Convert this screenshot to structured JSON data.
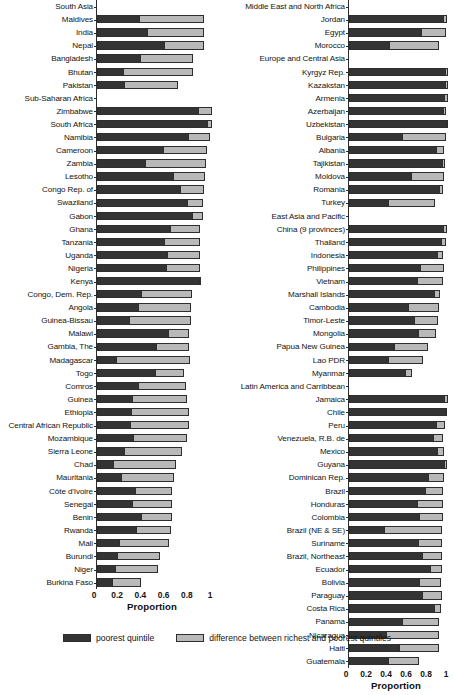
{
  "chart_data": {
    "type": "bar",
    "orientation": "horizontal",
    "stacked": true,
    "title": "",
    "xlabel": "Proportion",
    "ylabel": "",
    "xlim": [
      0,
      1
    ],
    "xticks": [
      "0",
      "0.2",
      "0.4",
      "0.6",
      "0.8",
      "1"
    ],
    "xtick_values": [
      0,
      0.2,
      0.4,
      0.6,
      0.8,
      1
    ],
    "grid": false,
    "legend_position": "bottom",
    "series": [
      {
        "name": "poorest quintile",
        "color": "#343434"
      },
      {
        "name": "difference between richest and poorest quintiles",
        "color": "#b9b9b9"
      }
    ],
    "panels": [
      {
        "panel_id": "left",
        "rows": [
          {
            "label": "South Asia",
            "group": true,
            "poorest": null,
            "difference": null
          },
          {
            "label": "Maldives",
            "group": false,
            "poorest": 0.36,
            "difference": 0.56
          },
          {
            "label": "India",
            "group": false,
            "poorest": 0.43,
            "difference": 0.49
          },
          {
            "label": "Nepal",
            "group": false,
            "poorest": 0.58,
            "difference": 0.34
          },
          {
            "label": "Bangladesh",
            "group": false,
            "poorest": 0.37,
            "difference": 0.46
          },
          {
            "label": "Bhutan",
            "group": false,
            "poorest": 0.22,
            "difference": 0.61
          },
          {
            "label": "Pakistan",
            "group": false,
            "poorest": 0.23,
            "difference": 0.47
          },
          {
            "label": "Sub-Saharan Africa",
            "group": true,
            "poorest": null,
            "difference": null
          },
          {
            "label": "Zimbabwe",
            "group": false,
            "poorest": 0.88,
            "difference": 0.11
          },
          {
            "label": "South Africa",
            "group": false,
            "poorest": 0.96,
            "difference": 0.03
          },
          {
            "label": "Namibia",
            "group": false,
            "poorest": 0.79,
            "difference": 0.18
          },
          {
            "label": "Cameroon",
            "group": false,
            "poorest": 0.57,
            "difference": 0.38
          },
          {
            "label": "Zambia",
            "group": false,
            "poorest": 0.41,
            "difference": 0.53
          },
          {
            "label": "Lesotho",
            "group": false,
            "poorest": 0.66,
            "difference": 0.27
          },
          {
            "label": "Congo Rep. of",
            "group": false,
            "poorest": 0.72,
            "difference": 0.2
          },
          {
            "label": "Swaziland",
            "group": false,
            "poorest": 0.78,
            "difference": 0.13
          },
          {
            "label": "Gabon",
            "group": false,
            "poorest": 0.83,
            "difference": 0.08
          },
          {
            "label": "Ghana",
            "group": false,
            "poorest": 0.63,
            "difference": 0.26
          },
          {
            "label": "Tanzania",
            "group": false,
            "poorest": 0.58,
            "difference": 0.31
          },
          {
            "label": "Uganda",
            "group": false,
            "poorest": 0.61,
            "difference": 0.28
          },
          {
            "label": "Nigeria",
            "group": false,
            "poorest": 0.6,
            "difference": 0.29
          },
          {
            "label": "Kenya",
            "group": false,
            "poorest": 0.9,
            "difference": 0.0
          },
          {
            "label": "Congo, Dem. Rep.",
            "group": false,
            "poorest": 0.38,
            "difference": 0.44
          },
          {
            "label": "Angola",
            "group": false,
            "poorest": 0.35,
            "difference": 0.46
          },
          {
            "label": "Guinea-Bissau",
            "group": false,
            "poorest": 0.27,
            "difference": 0.54
          },
          {
            "label": "Malawi",
            "group": false,
            "poorest": 0.62,
            "difference": 0.17
          },
          {
            "label": "Gambia, The",
            "group": false,
            "poorest": 0.51,
            "difference": 0.28
          },
          {
            "label": "Madagascar",
            "group": false,
            "poorest": 0.16,
            "difference": 0.64
          },
          {
            "label": "Togo",
            "group": false,
            "poorest": 0.5,
            "difference": 0.25
          },
          {
            "label": "Comros",
            "group": false,
            "poorest": 0.35,
            "difference": 0.42
          },
          {
            "label": "Guinea",
            "group": false,
            "poorest": 0.3,
            "difference": 0.48
          },
          {
            "label": "Ethiopia",
            "group": false,
            "poorest": 0.29,
            "difference": 0.5
          },
          {
            "label": "Central African Republic",
            "group": false,
            "poorest": 0.28,
            "difference": 0.51
          },
          {
            "label": "Mozambique",
            "group": false,
            "poorest": 0.31,
            "difference": 0.47
          },
          {
            "label": "Sierra Leone",
            "group": false,
            "poorest": 0.23,
            "difference": 0.5
          },
          {
            "label": "Chad",
            "group": false,
            "poorest": 0.13,
            "difference": 0.55
          },
          {
            "label": "Mauritania",
            "group": false,
            "poorest": 0.2,
            "difference": 0.46
          },
          {
            "label": "Côte d'Ivoire",
            "group": false,
            "poorest": 0.33,
            "difference": 0.32
          },
          {
            "label": "Senegal",
            "group": false,
            "poorest": 0.3,
            "difference": 0.35
          },
          {
            "label": "Benin",
            "group": false,
            "poorest": 0.38,
            "difference": 0.27
          },
          {
            "label": "Rwanda",
            "group": false,
            "poorest": 0.34,
            "difference": 0.3
          },
          {
            "label": "Mali",
            "group": false,
            "poorest": 0.19,
            "difference": 0.43
          },
          {
            "label": "Burundi",
            "group": false,
            "poorest": 0.17,
            "difference": 0.37
          },
          {
            "label": "Niger",
            "group": false,
            "poorest": 0.15,
            "difference": 0.38
          },
          {
            "label": "Burkina Faso",
            "group": false,
            "poorest": 0.13,
            "difference": 0.25
          }
        ]
      },
      {
        "panel_id": "right",
        "rows": [
          {
            "label": "Middle East and North Africa",
            "group": true,
            "poorest": null,
            "difference": null
          },
          {
            "label": "Jordan",
            "group": false,
            "poorest": 0.95,
            "difference": 0.03
          },
          {
            "label": "Egypt",
            "group": false,
            "poorest": 0.72,
            "difference": 0.25
          },
          {
            "label": "Morocco",
            "group": false,
            "poorest": 0.4,
            "difference": 0.5
          },
          {
            "label": "Europe and Central Asia",
            "group": true,
            "poorest": null,
            "difference": null
          },
          {
            "label": "Kyrgyz Rep.",
            "group": false,
            "poorest": 0.97,
            "difference": 0.02
          },
          {
            "label": "Kazakstan",
            "group": false,
            "poorest": 0.97,
            "difference": 0.02
          },
          {
            "label": "Armenia",
            "group": false,
            "poorest": 0.96,
            "difference": 0.03
          },
          {
            "label": "Azerbaijan",
            "group": false,
            "poorest": 0.95,
            "difference": 0.02
          },
          {
            "label": "Uzbekistan",
            "group": false,
            "poorest": 0.98,
            "difference": 0.01
          },
          {
            "label": "Bulgaria",
            "group": false,
            "poorest": 0.53,
            "difference": 0.44
          },
          {
            "label": "Albania",
            "group": false,
            "poorest": 0.88,
            "difference": 0.07
          },
          {
            "label": "Tajikistan",
            "group": false,
            "poorest": 0.94,
            "difference": 0.02
          },
          {
            "label": "Moldova",
            "group": false,
            "poorest": 0.62,
            "difference": 0.33
          },
          {
            "label": "Romania",
            "group": false,
            "poorest": 0.91,
            "difference": 0.03
          },
          {
            "label": "Turkey",
            "group": false,
            "poorest": 0.39,
            "difference": 0.47
          },
          {
            "label": "East Asia and Pacific",
            "group": true,
            "poorest": null,
            "difference": null
          },
          {
            "label": "China (9 provinces)",
            "group": false,
            "poorest": 0.95,
            "difference": 0.03
          },
          {
            "label": "Thailand",
            "group": false,
            "poorest": 0.93,
            "difference": 0.04
          },
          {
            "label": "Indonesia",
            "group": false,
            "poorest": 0.89,
            "difference": 0.05
          },
          {
            "label": "Philippines",
            "group": false,
            "poorest": 0.72,
            "difference": 0.23
          },
          {
            "label": "Vietnam",
            "group": false,
            "poorest": 0.68,
            "difference": 0.26
          },
          {
            "label": "Marshall Islands",
            "group": false,
            "poorest": 0.86,
            "difference": 0.05
          },
          {
            "label": "Cambodia",
            "group": false,
            "poorest": 0.59,
            "difference": 0.31
          },
          {
            "label": "Timor-Leste",
            "group": false,
            "poorest": 0.65,
            "difference": 0.24
          },
          {
            "label": "Mongolia",
            "group": false,
            "poorest": 0.7,
            "difference": 0.17
          },
          {
            "label": "Papua New Guinea",
            "group": false,
            "poorest": 0.45,
            "difference": 0.34
          },
          {
            "label": "Lao PDR",
            "group": false,
            "poorest": 0.39,
            "difference": 0.35
          },
          {
            "label": "Myanmar",
            "group": false,
            "poorest": 0.57,
            "difference": 0.06
          },
          {
            "label": "Latin America and Carribbean",
            "group": true,
            "poorest": null,
            "difference": null
          },
          {
            "label": "Jamaica",
            "group": false,
            "poorest": 0.96,
            "difference": 0.03
          },
          {
            "label": "Chile",
            "group": false,
            "poorest": 0.97,
            "difference": 0.01
          },
          {
            "label": "Peru",
            "group": false,
            "poorest": 0.88,
            "difference": 0.08
          },
          {
            "label": "Venezuela, R.B. de",
            "group": false,
            "poorest": 0.85,
            "difference": 0.09
          },
          {
            "label": "Mexico",
            "group": false,
            "poorest": 0.89,
            "difference": 0.06
          },
          {
            "label": "Guyana",
            "group": false,
            "poorest": 0.96,
            "difference": 0.02
          },
          {
            "label": "Dominican Rep.",
            "group": false,
            "poorest": 0.8,
            "difference": 0.15
          },
          {
            "label": "Brazil",
            "group": false,
            "poorest": 0.77,
            "difference": 0.17
          },
          {
            "label": "Honduras",
            "group": false,
            "poorest": 0.68,
            "difference": 0.26
          },
          {
            "label": "Colombia",
            "group": false,
            "poorest": 0.71,
            "difference": 0.23
          },
          {
            "label": "Brazil (NE & SE)",
            "group": false,
            "poorest": 0.35,
            "difference": 0.58
          },
          {
            "label": "Suriname",
            "group": false,
            "poorest": 0.7,
            "difference": 0.23
          },
          {
            "label": "Brazil, Northeast",
            "group": false,
            "poorest": 0.74,
            "difference": 0.19
          },
          {
            "label": "Ecuador",
            "group": false,
            "poorest": 0.82,
            "difference": 0.11
          },
          {
            "label": "Bolivia",
            "group": false,
            "poorest": 0.71,
            "difference": 0.21
          },
          {
            "label": "Paraguay",
            "group": false,
            "poorest": 0.74,
            "difference": 0.19
          },
          {
            "label": "Costa Rica",
            "group": false,
            "poorest": 0.86,
            "difference": 0.06
          },
          {
            "label": "Panama",
            "group": false,
            "poorest": 0.53,
            "difference": 0.37
          },
          {
            "label": "Nicaragua",
            "group": false,
            "poorest": 0.37,
            "difference": 0.53
          },
          {
            "label": "Haiti",
            "group": false,
            "poorest": 0.5,
            "difference": 0.4
          },
          {
            "label": "Guatemala",
            "group": false,
            "poorest": 0.39,
            "difference": 0.31
          }
        ]
      }
    ]
  },
  "legend": {
    "items": [
      {
        "label": "poorest quintile",
        "color": "#343434"
      },
      {
        "label": "difference between richest and poorest quintiles",
        "color": "#b9b9b9"
      }
    ]
  },
  "axis": {
    "title": "Proportion",
    "ticks": [
      "0",
      "0.2",
      "0.4",
      "0.6",
      "0.8",
      "1"
    ]
  }
}
